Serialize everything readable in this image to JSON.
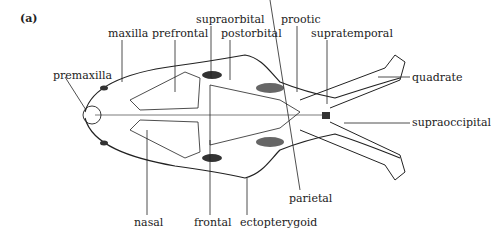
{
  "figure": {
    "panel_label": "(a)",
    "labels": {
      "maxilla": "maxilla",
      "prefrontal": "prefrontal",
      "supraorbital": "supraorbital",
      "postorbital": "postorbital",
      "prootic": "prootic",
      "supratemporal": "supratemporal",
      "quadrate": "quadrate",
      "premaxilla": "premaxilla",
      "supraoccipital": "supraoccipital",
      "parietal": "parietal",
      "nasal": "nasal",
      "frontal": "frontal",
      "ectopterygoid": "ectopterygoid"
    }
  }
}
